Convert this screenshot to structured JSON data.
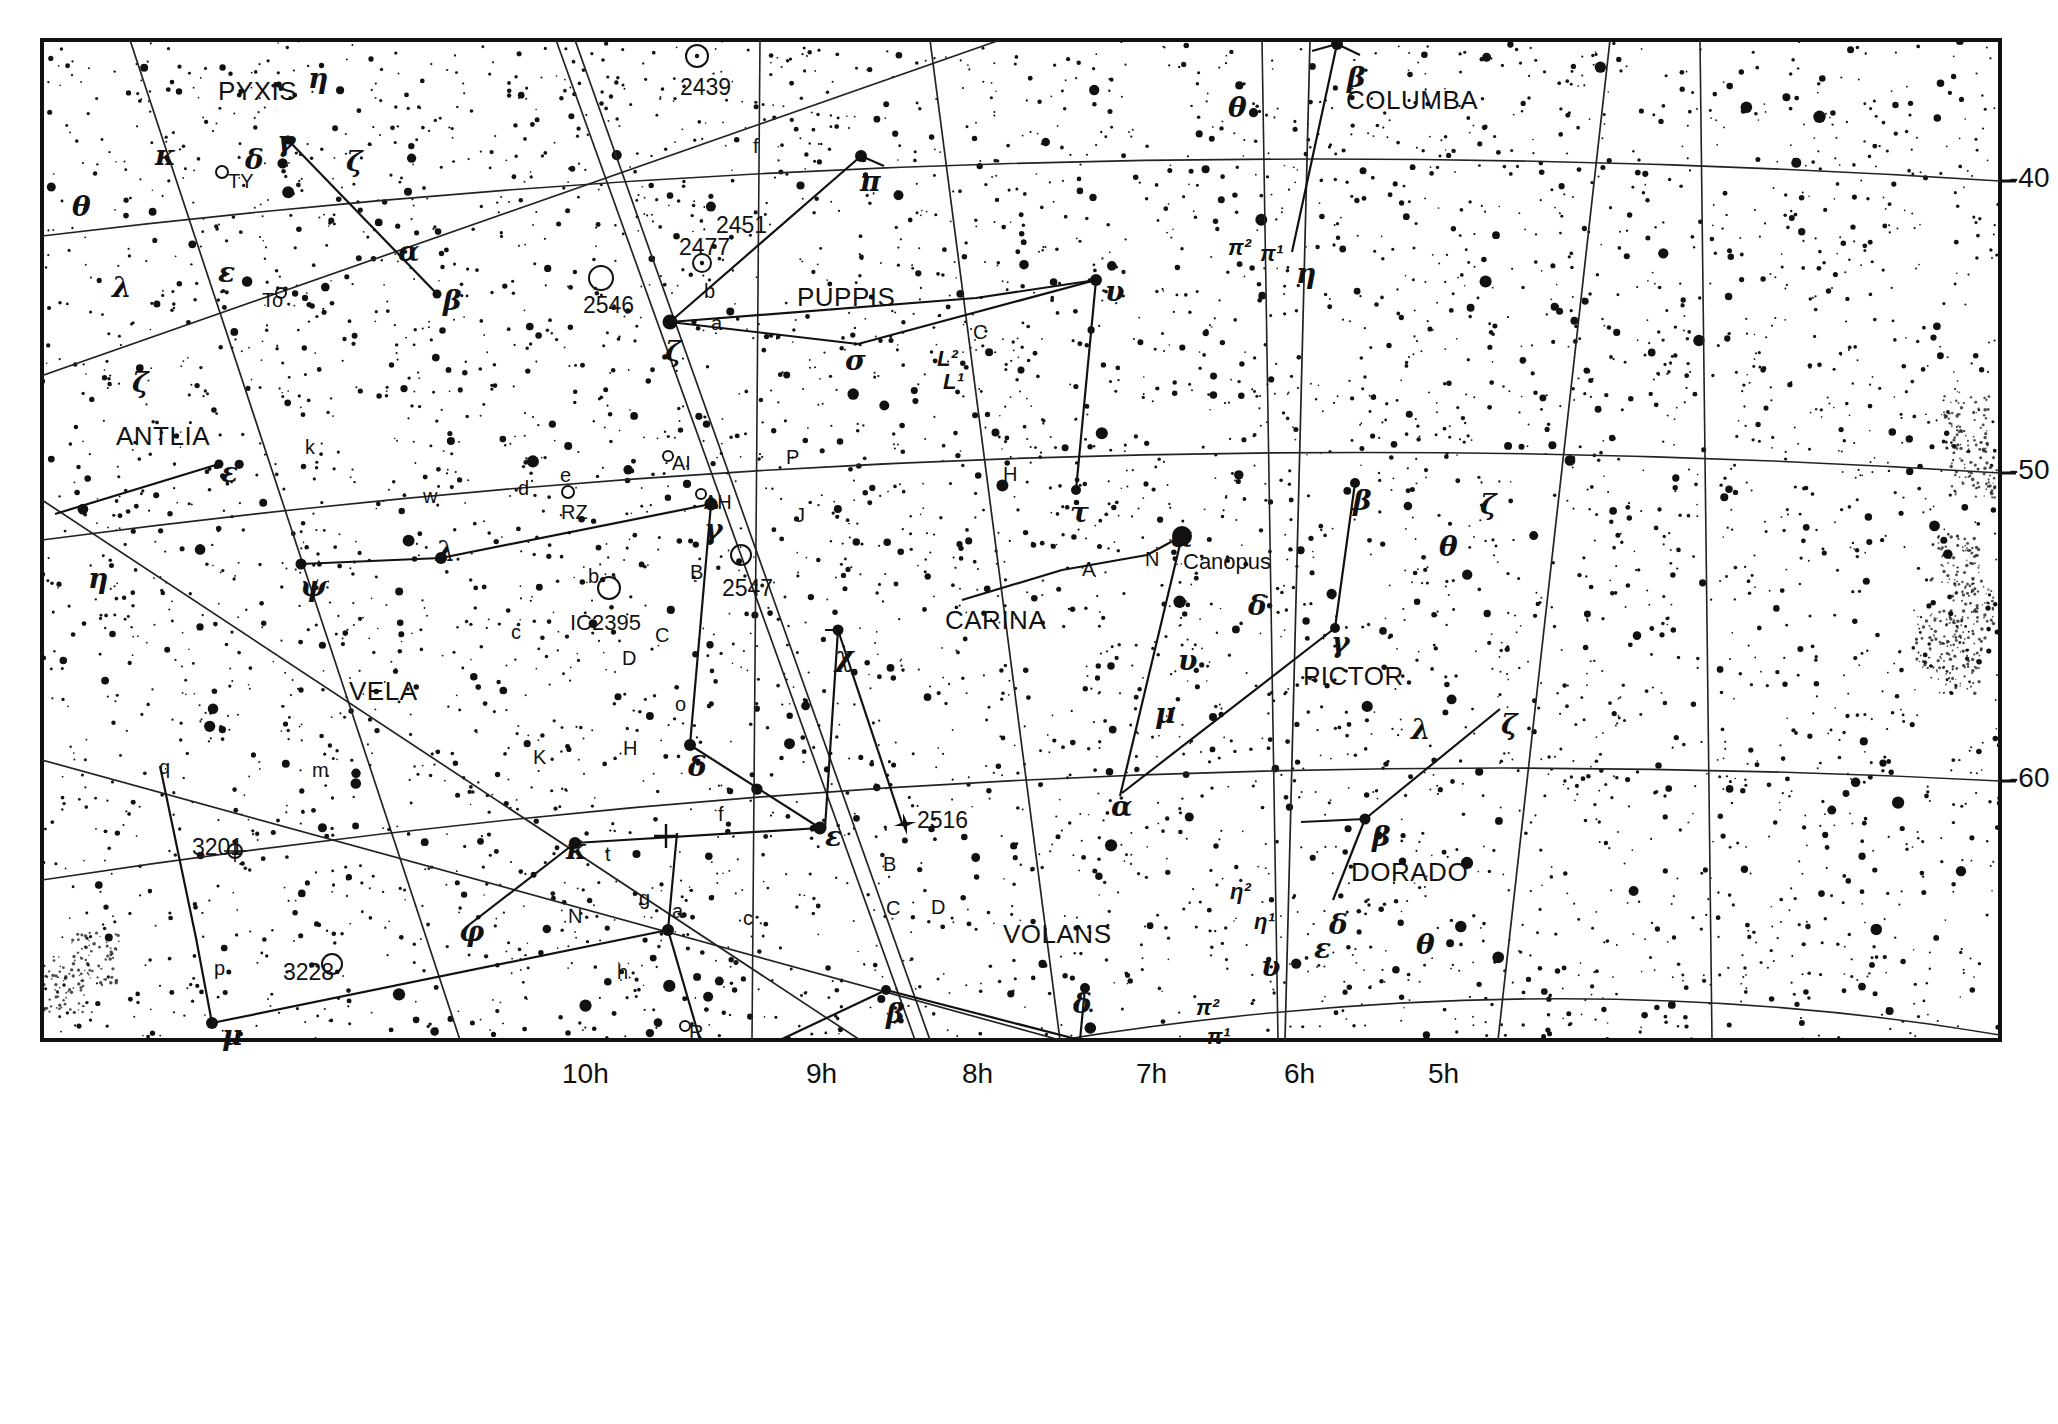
{
  "chart_data": {
    "type": "star-chart",
    "projection": "equatorial conic",
    "ra_axis": {
      "label": "Right Ascension",
      "position": "bottom",
      "ticks": [
        "10h",
        "9h",
        "8h",
        "7h",
        "6h",
        "5h"
      ],
      "tick_x": [
        562,
        806,
        962,
        1136,
        1284,
        1428
      ]
    },
    "dec_axis": {
      "label": "Declination",
      "position": "right",
      "ticks": [
        "-40",
        "-50",
        "-60"
      ],
      "tick_y": [
        181,
        473,
        781
      ]
    },
    "grid": true,
    "legend": "none"
  },
  "constellations": [
    {
      "name": "PYXIS",
      "x": 218,
      "y": 78
    },
    {
      "name": "ANTLIA",
      "x": 116,
      "y": 423
    },
    {
      "name": "VELA",
      "x": 349,
      "y": 678
    },
    {
      "name": "PUPPIS",
      "x": 797,
      "y": 284
    },
    {
      "name": "CARINA",
      "x": 945,
      "y": 607
    },
    {
      "name": "VOLANS",
      "x": 1003,
      "y": 921
    },
    {
      "name": "COLUMBA",
      "x": 1346,
      "y": 87
    },
    {
      "name": "PICTOR",
      "x": 1303,
      "y": 663
    },
    {
      "name": "DORADO",
      "x": 1351,
      "y": 859
    }
  ],
  "star_labels": [
    {
      "text": "θ",
      "x": 72,
      "y": 193,
      "kind": "greek"
    },
    {
      "text": "κ",
      "x": 155,
      "y": 142,
      "kind": "greek"
    },
    {
      "text": "λ",
      "x": 112,
      "y": 274,
      "kind": "greek"
    },
    {
      "text": "δ",
      "x": 245,
      "y": 146,
      "kind": "greek"
    },
    {
      "text": "γ",
      "x": 277,
      "y": 128,
      "kind": "greek"
    },
    {
      "text": "ζ",
      "x": 346,
      "y": 148,
      "kind": "greek"
    },
    {
      "text": "η",
      "x": 308,
      "y": 65,
      "kind": "greek"
    },
    {
      "text": "ε",
      "x": 218,
      "y": 259,
      "kind": "greek"
    },
    {
      "text": "TY",
      "x": 228,
      "y": 171,
      "kind": "var"
    },
    {
      "text": "To",
      "x": 262,
      "y": 290,
      "kind": "var"
    },
    {
      "text": "α",
      "x": 398,
      "y": 238,
      "kind": "greek"
    },
    {
      "text": "β",
      "x": 443,
      "y": 287,
      "kind": "greek"
    },
    {
      "text": "ζ",
      "x": 132,
      "y": 369,
      "kind": "greek"
    },
    {
      "text": "ε",
      "x": 221,
      "y": 459,
      "kind": "greek"
    },
    {
      "text": "η",
      "x": 88,
      "y": 565,
      "kind": "greek"
    },
    {
      "text": "k",
      "x": 305,
      "y": 437,
      "kind": "lat"
    },
    {
      "text": "w",
      "x": 423,
      "y": 486,
      "kind": "lat"
    },
    {
      "text": "λ",
      "x": 436,
      "y": 538,
      "kind": "greek"
    },
    {
      "text": "ψ",
      "x": 300,
      "y": 573,
      "kind": "greek"
    },
    {
      "text": "q",
      "x": 159,
      "y": 757,
      "kind": "lat"
    },
    {
      "text": "m",
      "x": 312,
      "y": 760,
      "kind": "lat"
    },
    {
      "text": "3201",
      "x": 192,
      "y": 836,
      "kind": "ngc"
    },
    {
      "text": "3228",
      "x": 283,
      "y": 961,
      "kind": "ngc"
    },
    {
      "text": "p",
      "x": 214,
      "y": 958,
      "kind": "lat"
    },
    {
      "text": "μ",
      "x": 222,
      "y": 1022,
      "kind": "greek"
    },
    {
      "text": "φ",
      "x": 459,
      "y": 918,
      "kind": "greek"
    },
    {
      "text": "κ",
      "x": 566,
      "y": 836,
      "kind": "greek"
    },
    {
      "text": "t",
      "x": 605,
      "y": 844,
      "kind": "lat"
    },
    {
      "text": "N",
      "x": 568,
      "y": 906,
      "kind": "lat"
    },
    {
      "text": "g",
      "x": 639,
      "y": 888,
      "kind": "lat"
    },
    {
      "text": "a",
      "x": 672,
      "y": 901,
      "kind": "lat"
    },
    {
      "text": "h",
      "x": 617,
      "y": 962,
      "kind": "lat"
    },
    {
      "text": "R",
      "x": 689,
      "y": 1022,
      "kind": "lat"
    },
    {
      "text": "K",
      "x": 533,
      "y": 747,
      "kind": "lat"
    },
    {
      "text": "H",
      "x": 623,
      "y": 738,
      "kind": "lat"
    },
    {
      "text": "c",
      "x": 511,
      "y": 622,
      "kind": "lat"
    },
    {
      "text": "D",
      "x": 622,
      "y": 648,
      "kind": "lat"
    },
    {
      "text": "C",
      "x": 655,
      "y": 625,
      "kind": "lat"
    },
    {
      "text": "IC2395",
      "x": 570,
      "y": 612,
      "kind": "ngc-sm"
    },
    {
      "text": "b",
      "x": 588,
      "y": 566,
      "kind": "lat"
    },
    {
      "text": "B",
      "x": 690,
      "y": 562,
      "kind": "lat"
    },
    {
      "text": "d",
      "x": 518,
      "y": 478,
      "kind": "lat"
    },
    {
      "text": "e",
      "x": 560,
      "y": 465,
      "kind": "lat"
    },
    {
      "text": "RZ",
      "x": 561,
      "y": 502,
      "kind": "var"
    },
    {
      "text": "AI",
      "x": 672,
      "y": 453,
      "kind": "var"
    },
    {
      "text": "AH",
      "x": 704,
      "y": 492,
      "kind": "var"
    },
    {
      "text": "γ",
      "x": 704,
      "y": 516,
      "kind": "greek"
    },
    {
      "text": "2547",
      "x": 722,
      "y": 577,
      "kind": "ngc"
    },
    {
      "text": "o",
      "x": 675,
      "y": 694,
      "kind": "lat"
    },
    {
      "text": "δ",
      "x": 688,
      "y": 753,
      "kind": "greek"
    },
    {
      "text": "f",
      "x": 718,
      "y": 804,
      "kind": "lat"
    },
    {
      "text": "c",
      "x": 743,
      "y": 908,
      "kind": "lat"
    },
    {
      "text": "ζ",
      "x": 665,
      "y": 338,
      "kind": "greek"
    },
    {
      "text": "a",
      "x": 711,
      "y": 313,
      "kind": "lat"
    },
    {
      "text": "b",
      "x": 704,
      "y": 281,
      "kind": "lat"
    },
    {
      "text": "2477",
      "x": 679,
      "y": 236,
      "kind": "ngc"
    },
    {
      "text": "2451",
      "x": 716,
      "y": 214,
      "kind": "ngc"
    },
    {
      "text": "2546",
      "x": 583,
      "y": 294,
      "kind": "ngc"
    },
    {
      "text": "2439",
      "x": 680,
      "y": 76,
      "kind": "ngc"
    },
    {
      "text": "f",
      "x": 753,
      "y": 136,
      "kind": "lat"
    },
    {
      "text": "π",
      "x": 860,
      "y": 168,
      "kind": "greek"
    },
    {
      "text": "σ",
      "x": 845,
      "y": 347,
      "kind": "greek"
    },
    {
      "text": "C",
      "x": 973,
      "y": 322,
      "kind": "lat"
    },
    {
      "text": "L²",
      "x": 937,
      "y": 348,
      "kind": "lat-sup"
    },
    {
      "text": "L¹",
      "x": 943,
      "y": 371,
      "kind": "lat-sup"
    },
    {
      "text": "P",
      "x": 786,
      "y": 447,
      "kind": "lat"
    },
    {
      "text": "J",
      "x": 795,
      "y": 505,
      "kind": "lat"
    },
    {
      "text": "H",
      "x": 1003,
      "y": 464,
      "kind": "lat"
    },
    {
      "text": "υ",
      "x": 1105,
      "y": 278,
      "kind": "greek"
    },
    {
      "text": "τ",
      "x": 1070,
      "y": 499,
      "kind": "greek"
    },
    {
      "text": "A",
      "x": 1082,
      "y": 559,
      "kind": "lat"
    },
    {
      "text": "N",
      "x": 1145,
      "y": 549,
      "kind": "lat"
    },
    {
      "text": "α",
      "x": 1171,
      "y": 524,
      "kind": "greek"
    },
    {
      "text": "Canopus",
      "x": 1183,
      "y": 551,
      "kind": "proper"
    },
    {
      "text": "δ",
      "x": 1248,
      "y": 592,
      "kind": "greek"
    },
    {
      "text": "υ",
      "x": 1178,
      "y": 647,
      "kind": "greek"
    },
    {
      "text": "μ",
      "x": 1155,
      "y": 700,
      "kind": "greek"
    },
    {
      "text": "α",
      "x": 1111,
      "y": 793,
      "kind": "greek"
    },
    {
      "text": "χ",
      "x": 835,
      "y": 643,
      "kind": "greek"
    },
    {
      "text": "ε",
      "x": 825,
      "y": 823,
      "kind": "greek"
    },
    {
      "text": "2516",
      "x": 917,
      "y": 809,
      "kind": "ngc"
    },
    {
      "text": "B",
      "x": 883,
      "y": 854,
      "kind": "lat"
    },
    {
      "text": "C",
      "x": 886,
      "y": 898,
      "kind": "lat"
    },
    {
      "text": "D",
      "x": 931,
      "y": 897,
      "kind": "lat"
    },
    {
      "text": "β",
      "x": 886,
      "y": 1000,
      "kind": "greek"
    },
    {
      "text": "δ",
      "x": 1073,
      "y": 990,
      "kind": "greek"
    },
    {
      "text": "θ",
      "x": 1228,
      "y": 94,
      "kind": "greek"
    },
    {
      "text": "β",
      "x": 1347,
      "y": 64,
      "kind": "greek"
    },
    {
      "text": "π²",
      "x": 1228,
      "y": 237,
      "kind": "lat-sup"
    },
    {
      "text": "π¹",
      "x": 1260,
      "y": 243,
      "kind": "lat-sup"
    },
    {
      "text": "η",
      "x": 1296,
      "y": 260,
      "kind": "greek"
    },
    {
      "text": "β",
      "x": 1353,
      "y": 487,
      "kind": "greek"
    },
    {
      "text": "ζ",
      "x": 1480,
      "y": 491,
      "kind": "greek"
    },
    {
      "text": "θ",
      "x": 1439,
      "y": 533,
      "kind": "greek"
    },
    {
      "text": "γ",
      "x": 1331,
      "y": 629,
      "kind": "greek"
    },
    {
      "text": "λ",
      "x": 1411,
      "y": 716,
      "kind": "greek"
    },
    {
      "text": "ζ",
      "x": 1501,
      "y": 711,
      "kind": "greek"
    },
    {
      "text": "β",
      "x": 1372,
      "y": 823,
      "kind": "greek"
    },
    {
      "text": "δ",
      "x": 1329,
      "y": 911,
      "kind": "greek"
    },
    {
      "text": "ε",
      "x": 1314,
      "y": 935,
      "kind": "greek"
    },
    {
      "text": "θ",
      "x": 1416,
      "y": 931,
      "kind": "greek"
    },
    {
      "text": "η²",
      "x": 1230,
      "y": 881,
      "kind": "lat-sup"
    },
    {
      "text": "η¹",
      "x": 1254,
      "y": 911,
      "kind": "lat-sup"
    },
    {
      "text": "υ",
      "x": 1261,
      "y": 953,
      "kind": "greek"
    },
    {
      "text": "π²",
      "x": 1196,
      "y": 997,
      "kind": "lat-sup"
    },
    {
      "text": "π¹",
      "x": 1207,
      "y": 1026,
      "kind": "lat-sup"
    }
  ]
}
